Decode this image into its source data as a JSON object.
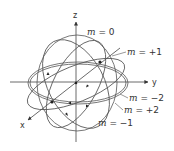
{
  "diagram": {
    "axes": {
      "x": "x",
      "y": "y",
      "z": "z"
    },
    "labels": [
      {
        "var": "m",
        "eq": " = ",
        "val": "0"
      },
      {
        "var": "m",
        "eq": " = ",
        "val": "+1"
      },
      {
        "var": "m",
        "eq": " = ",
        "val": "−2"
      },
      {
        "var": "m",
        "eq": " = ",
        "val": "+2"
      },
      {
        "var": "m",
        "eq": " = ",
        "val": "−1"
      }
    ],
    "colors": {
      "line": "#555555",
      "text": "#333333",
      "background": "#ffffff"
    }
  }
}
